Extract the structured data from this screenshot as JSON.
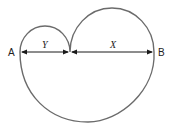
{
  "diagram": {
    "points": {
      "a": "A",
      "b": "B"
    },
    "segments": {
      "y_label": "Y",
      "x_label": "X"
    },
    "colors": {
      "curve": "#6b6b6b",
      "arrow": "#1a1a1a",
      "text": "#222222"
    }
  }
}
